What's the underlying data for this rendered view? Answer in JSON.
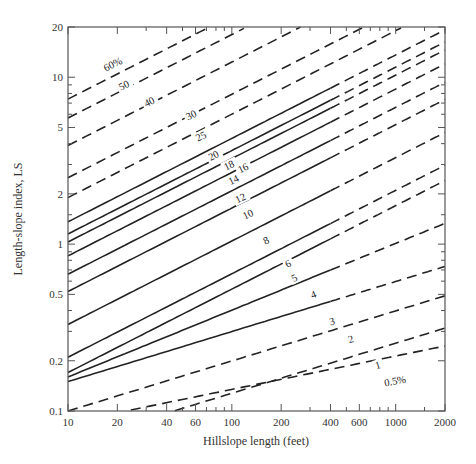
{
  "chart_data": {
    "type": "line",
    "title": "",
    "xlabel": "Hillslope length (feet)",
    "ylabel": "Length-slope index, LS",
    "xscale": "log",
    "yscale": "log",
    "xlim": [
      10,
      2000
    ],
    "ylim": [
      0.1,
      20
    ],
    "grid": false,
    "legend": "none (curves labeled inline by slope %)",
    "x_ticks": [
      10,
      20,
      40,
      60,
      100,
      200,
      400,
      600,
      1000,
      2000
    ],
    "x_tick_labels": [
      "10",
      "20",
      "40",
      "60",
      "100",
      "200",
      "400",
      "600",
      "1000",
      "2000"
    ],
    "y_ticks": [
      0.1,
      0.2,
      0.5,
      1,
      2,
      5,
      10,
      20
    ],
    "y_tick_labels": [
      "0.1",
      "0.2",
      "0.5",
      "1",
      "2",
      "5",
      "10",
      "20"
    ],
    "note": "Solid portions end at 400 ft for slopes 3–20%; beyond and outside that range lines are dashed",
    "solid_limit_ft": 400,
    "series": [
      {
        "name": "60%",
        "label": "60%",
        "ls_at_10ft": 7.4,
        "exponent": 0.5,
        "style": "dashed",
        "label_at": [
          17,
          10.8
        ]
      },
      {
        "name": "50%",
        "label": "50",
        "ls_at_10ft": 5.7,
        "exponent": 0.5,
        "style": "dashed",
        "label_at": [
          21,
          8.3
        ]
      },
      {
        "name": "40%",
        "label": "40",
        "ls_at_10ft": 3.9,
        "exponent": 0.5,
        "style": "dashed",
        "label_at": [
          30,
          6.6
        ]
      },
      {
        "name": "30%",
        "label": "30",
        "ls_at_10ft": 2.5,
        "exponent": 0.5,
        "style": "dashed",
        "label_at": [
          54,
          5.5
        ]
      },
      {
        "name": "25%",
        "label": "25",
        "ls_at_10ft": 1.9,
        "exponent": 0.5,
        "style": "dashed",
        "label_at": [
          62,
          4.1
        ]
      },
      {
        "name": "20%",
        "label": "20",
        "ls_at_10ft": 1.36,
        "exponent": 0.5,
        "style": "solid-then-dashed",
        "label_at": [
          74,
          3.15
        ]
      },
      {
        "name": "18%",
        "label": "18",
        "ls_at_10ft": 1.15,
        "exponent": 0.5,
        "style": "solid-then-dashed",
        "label_at": [
          92,
          2.75
        ]
      },
      {
        "name": "16%",
        "label": "16",
        "ls_at_10ft": 1.03,
        "exponent": 0.5,
        "style": "solid-then-dashed",
        "label_at": [
          112,
          2.65
        ]
      },
      {
        "name": "14%",
        "label": "14",
        "ls_at_10ft": 0.85,
        "exponent": 0.5,
        "style": "solid-then-dashed",
        "label_at": [
          98,
          2.25
        ]
      },
      {
        "name": "12%",
        "label": "12",
        "ls_at_10ft": 0.66,
        "exponent": 0.5,
        "style": "solid-then-dashed",
        "label_at": [
          108,
          1.75
        ]
      },
      {
        "name": "10%",
        "label": "10",
        "ls_at_10ft": 0.52,
        "exponent": 0.5,
        "style": "solid-then-dashed",
        "label_at": [
          120,
          1.4
        ]
      },
      {
        "name": "8%",
        "label": "8",
        "ls_at_10ft": 0.33,
        "exponent": 0.5,
        "style": "solid-then-dashed",
        "label_at": [
          160,
          0.99
        ]
      },
      {
        "name": "6%",
        "label": "6",
        "ls_at_10ft": 0.21,
        "exponent": 0.5,
        "style": "solid-then-dashed",
        "label_at": [
          218,
          0.72
        ]
      },
      {
        "name": "5%",
        "label": "5",
        "ls_at_10ft": 0.17,
        "exponent": 0.5,
        "style": "solid-then-dashed",
        "label_at": [
          238,
          0.59
        ]
      },
      {
        "name": "4%",
        "label": "4",
        "ls_at_10ft": 0.16,
        "exponent": 0.4,
        "style": "solid-then-dashed",
        "label_at": [
          310,
          0.47
        ]
      },
      {
        "name": "3%",
        "label": "3",
        "ls_at_10ft": 0.15,
        "exponent": 0.3,
        "style": "solid-then-dashed",
        "label_at": [
          400,
          0.325
        ]
      },
      {
        "name": "2%",
        "label": "2",
        "ls_at_10ft": 0.1,
        "exponent": 0.3,
        "style": "dashed",
        "label_at": [
          520,
          0.255
        ]
      },
      {
        "name": "1%",
        "label": "1",
        "ls_at_10ft": 0.064,
        "exponent": 0.3,
        "style": "dashed",
        "label_at": [
          760,
          0.178
        ]
      },
      {
        "name": "0.5%",
        "label": "0.5%",
        "ls_at_10ft": 0.085,
        "exponent": 0.2,
        "style": "dashed",
        "label_at": [
          860,
          0.14
        ]
      }
    ]
  }
}
